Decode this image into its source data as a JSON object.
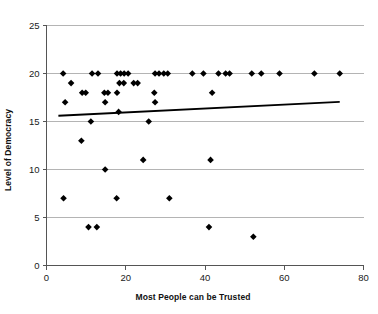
{
  "chart_data": {
    "type": "scatter",
    "title": "",
    "xlabel": "Most People can be Trusted",
    "ylabel": "Level of Democracy",
    "xlim": [
      0,
      80
    ],
    "ylim": [
      0,
      25
    ],
    "xticks": [
      0,
      20,
      40,
      60,
      80
    ],
    "yticks": [
      0,
      5,
      10,
      15,
      20,
      25
    ],
    "grid": "horizontal",
    "legend": "none",
    "marker_style": "filled-diamond",
    "marker_color": "#000000",
    "points": [
      {
        "x": 4.2,
        "y": 20
      },
      {
        "x": 11.5,
        "y": 20
      },
      {
        "x": 13.0,
        "y": 20
      },
      {
        "x": 17.8,
        "y": 20
      },
      {
        "x": 18.7,
        "y": 20
      },
      {
        "x": 19.6,
        "y": 20
      },
      {
        "x": 20.6,
        "y": 20
      },
      {
        "x": 27.4,
        "y": 20
      },
      {
        "x": 28.4,
        "y": 20
      },
      {
        "x": 29.6,
        "y": 20
      },
      {
        "x": 30.6,
        "y": 20
      },
      {
        "x": 36.8,
        "y": 20
      },
      {
        "x": 39.6,
        "y": 20
      },
      {
        "x": 43.4,
        "y": 20
      },
      {
        "x": 45.2,
        "y": 20
      },
      {
        "x": 46.2,
        "y": 20
      },
      {
        "x": 51.8,
        "y": 20
      },
      {
        "x": 54.2,
        "y": 20
      },
      {
        "x": 58.8,
        "y": 20
      },
      {
        "x": 67.6,
        "y": 20
      },
      {
        "x": 74.0,
        "y": 20
      },
      {
        "x": 6.2,
        "y": 19
      },
      {
        "x": 18.4,
        "y": 19
      },
      {
        "x": 19.5,
        "y": 19
      },
      {
        "x": 22.0,
        "y": 19
      },
      {
        "x": 23.0,
        "y": 19
      },
      {
        "x": 9.0,
        "y": 18
      },
      {
        "x": 9.9,
        "y": 18
      },
      {
        "x": 14.6,
        "y": 18
      },
      {
        "x": 15.5,
        "y": 18
      },
      {
        "x": 17.8,
        "y": 18
      },
      {
        "x": 27.2,
        "y": 18
      },
      {
        "x": 41.8,
        "y": 18
      },
      {
        "x": 4.7,
        "y": 17
      },
      {
        "x": 14.8,
        "y": 17
      },
      {
        "x": 27.4,
        "y": 17
      },
      {
        "x": 18.2,
        "y": 16
      },
      {
        "x": 11.2,
        "y": 15
      },
      {
        "x": 25.8,
        "y": 15
      },
      {
        "x": 8.8,
        "y": 13
      },
      {
        "x": 24.4,
        "y": 11
      },
      {
        "x": 41.4,
        "y": 11
      },
      {
        "x": 14.8,
        "y": 10
      },
      {
        "x": 4.3,
        "y": 7
      },
      {
        "x": 17.7,
        "y": 7
      },
      {
        "x": 31.0,
        "y": 7
      },
      {
        "x": 10.6,
        "y": 4
      },
      {
        "x": 12.7,
        "y": 4
      },
      {
        "x": 41.0,
        "y": 4
      },
      {
        "x": 52.2,
        "y": 3
      }
    ],
    "trendline": {
      "x_start": 3.0,
      "y_start": 15.6,
      "x_end": 74.0,
      "y_end": 17.05,
      "color": "#000000"
    }
  }
}
